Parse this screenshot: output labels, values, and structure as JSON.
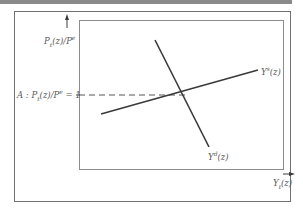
{
  "diagram": {
    "type": "supply-demand",
    "y_axis": {
      "label_base": "P",
      "label_sub": "t",
      "label_mid": "(z)/P",
      "label_sub2": "t",
      "label_sup2": "e",
      "full_label": "Pt(z)/Pt^e"
    },
    "x_axis": {
      "label_base": "Y",
      "label_sub": "t",
      "label_rest": "(z)",
      "full_label": "Yt(z)"
    },
    "reference_line": {
      "prefix": "A : P",
      "sub": "t",
      "mid": "(z)/P",
      "sub2": "t",
      "sup2": "e",
      "suffix": " = 1",
      "full_label": "A : Pt(z)/Pt^e = 1",
      "style": "dashed"
    },
    "curves": [
      {
        "name": "supply",
        "base": "Y",
        "sup": "s",
        "rest": "(z)",
        "full_label": "Y^s(z)",
        "slope": "upward"
      },
      {
        "name": "demand",
        "base": "Y",
        "sup": "d",
        "rest": "(z)",
        "full_label": "Y^d(z)",
        "slope": "downward"
      }
    ],
    "colors": {
      "line": "#3a3a3a",
      "frame": "#707070",
      "text": "#5a5a5a",
      "topbar": "#8a8a8a"
    }
  }
}
